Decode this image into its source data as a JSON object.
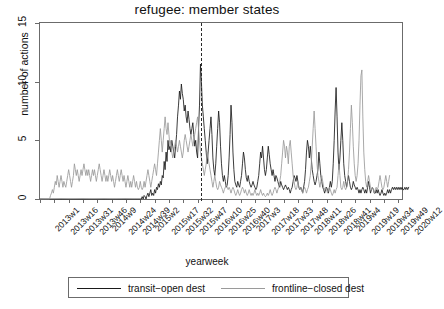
{
  "chart_data": {
    "type": "line",
    "title": "refugee: member states",
    "xlabel": "yearweek",
    "ylabel": "number of actions",
    "ylim": [
      0,
      15
    ],
    "yticks": [
      0,
      5,
      10,
      15
    ],
    "grid": false,
    "legend_position": "bottom",
    "annotations": [
      {
        "type": "vline",
        "style": "dashed",
        "x_index": 169,
        "x_label": "2016w20"
      }
    ],
    "x_tick_labels": [
      "2013w1",
      "2013w16",
      "2013w31",
      "2013w46",
      "2014w9",
      "2014w24",
      "2014w39",
      "2015w2",
      "2015w17",
      "2015w32",
      "2015w47",
      "2016w10",
      "2016w25",
      "2016w40",
      "2017w3",
      "2017w18",
      "2017w33",
      "2017w48",
      "2018w11",
      "2018w26",
      "2018w41",
      "2019w4",
      "2019w19",
      "2019w34",
      "2019w49",
      "2020w12"
    ],
    "x_tick_indices": [
      0,
      15,
      30,
      45,
      60,
      75,
      90,
      105,
      120,
      135,
      150,
      165,
      180,
      195,
      210,
      225,
      240,
      255,
      270,
      285,
      300,
      315,
      330,
      345,
      360,
      375
    ],
    "n_points": 380,
    "series": [
      {
        "name": "transit-open dest",
        "color": "#1a1a1a",
        "values": [
          0,
          0,
          0,
          0,
          0,
          0,
          0,
          0,
          0,
          0,
          0,
          0,
          0,
          0,
          0,
          0,
          0,
          0,
          0,
          0,
          0,
          0,
          0,
          0,
          0,
          0,
          0,
          0,
          0,
          0,
          0,
          0,
          0,
          0,
          0,
          0,
          0,
          0,
          0,
          0,
          0,
          0,
          0,
          0,
          0,
          0,
          0,
          0,
          0,
          0,
          0,
          0,
          0,
          0,
          0,
          0,
          0,
          0,
          0,
          0,
          0,
          0,
          0,
          0,
          0,
          0,
          0,
          0,
          0,
          0,
          0,
          0,
          0,
          0,
          0,
          0,
          0,
          0,
          0,
          0,
          0,
          0,
          0,
          0,
          0,
          0,
          0,
          0,
          0,
          0,
          0,
          0,
          0,
          0,
          0,
          0,
          0,
          0,
          0,
          0,
          0,
          0,
          0,
          0,
          0,
          0,
          0,
          0.2,
          0,
          0.3,
          0.2,
          0,
          0.3,
          0.5,
          0.2,
          0.5,
          0.8,
          0.3,
          0.5,
          0.3,
          0.8,
          0.5,
          1,
          0.8,
          1.3,
          1,
          1.5,
          1.2,
          2,
          1.8,
          3.2,
          2.5,
          4,
          3.2,
          5,
          4.2,
          4.5,
          4,
          5,
          4.5,
          4,
          3.5,
          4.5,
          5.5,
          7,
          8,
          9.2,
          8.5,
          9.8,
          9,
          8.5,
          7.5,
          8,
          7,
          6.5,
          7.5,
          6.8,
          6,
          5.5,
          6,
          6.5,
          5.5,
          4.5,
          5,
          4,
          3.5,
          6,
          8,
          11.5,
          10,
          8,
          7,
          6,
          5,
          4,
          3,
          4,
          5,
          6,
          7,
          5.5,
          3.5,
          2.5,
          2,
          3,
          4.5,
          6,
          7.5,
          6.5,
          4.5,
          3,
          2,
          1.5,
          2,
          1.5,
          1,
          1.2,
          2,
          3.5,
          5.5,
          8,
          6.5,
          4,
          2.5,
          1.5,
          1.2,
          1,
          1.5,
          1.2,
          1,
          1.5,
          2,
          3,
          4,
          3.5,
          2.5,
          1.8,
          1.5,
          2,
          1.5,
          1.2,
          1,
          1.2,
          1.5,
          1.2,
          1,
          0.8,
          1,
          1.5,
          2,
          3,
          4,
          3.5,
          4.5,
          3.5,
          2.5,
          2,
          2.5,
          3.5,
          4.5,
          3.8,
          3,
          2.5,
          2,
          2.5,
          2,
          1.5,
          2,
          1.8,
          1.5,
          1.2,
          1,
          1.5,
          1.2,
          1,
          0.8,
          1,
          1.2,
          1,
          0.8,
          1,
          0.8,
          0.5,
          0.8,
          1,
          1.5,
          2,
          1.8,
          1.5,
          2,
          1.5,
          1,
          0.8,
          1,
          0.8,
          0.5,
          1,
          1.5,
          2.5,
          4,
          5,
          4.5,
          3.5,
          4.5,
          3.5,
          2.5,
          2,
          1.5,
          1.2,
          1.5,
          2,
          2.5,
          4,
          3,
          2,
          1.5,
          1,
          0.8,
          0.5,
          0.8,
          1,
          0.8,
          0.5,
          1,
          1.5,
          1,
          1.5,
          3,
          5,
          7.5,
          9.5,
          7,
          4,
          2.5,
          3.5,
          5,
          6.5,
          5,
          3,
          2,
          1.5,
          1,
          1.5,
          2,
          1.5,
          1,
          0.8,
          1,
          1.5,
          1.2,
          1,
          0.8,
          1,
          0.8,
          0.5,
          0.8,
          0.5,
          0.8,
          1,
          0.8,
          0.5,
          0.8,
          0.5,
          1,
          1.5,
          1,
          0.5,
          0.8,
          1,
          0.8,
          0.5,
          0.5,
          0.8,
          0.5,
          0.8,
          0.5,
          0.3,
          0.5,
          0.8,
          0.5,
          0.3,
          0.5,
          0.3,
          0.5,
          0.8,
          0.5,
          0.8,
          0.5,
          0.8,
          1,
          0.8,
          1,
          0.8,
          1,
          0.8,
          1,
          0.8,
          1,
          0.8,
          1,
          0.8,
          0.8,
          1,
          0.8,
          1,
          0.8,
          1
        ]
      },
      {
        "name": "frontline-closed dest",
        "color": "#9a9a9a",
        "values": [
          0,
          0,
          0,
          0,
          0,
          0,
          0,
          0,
          0,
          0,
          0,
          0.3,
          0.5,
          0.8,
          0.5,
          1,
          1.5,
          1.2,
          2,
          1.5,
          1,
          1.5,
          2,
          1.5,
          1,
          1.5,
          1.2,
          1,
          1.5,
          2,
          2.5,
          2,
          1.5,
          1,
          1.5,
          2,
          3,
          2.5,
          2,
          2.5,
          2,
          1.5,
          2,
          2.5,
          2,
          2.5,
          3,
          2.5,
          2,
          2.5,
          2,
          2.5,
          2,
          1.5,
          2,
          2.5,
          2,
          2.5,
          2,
          1.5,
          2,
          2.5,
          3,
          2.5,
          2,
          1.5,
          2,
          2.5,
          2,
          1.5,
          2,
          1.5,
          2,
          2.5,
          2,
          1.5,
          2,
          1.5,
          1,
          1.5,
          2,
          2.5,
          2,
          1.5,
          2,
          2.5,
          2,
          1.5,
          2,
          1.5,
          1,
          1.5,
          2,
          1.5,
          1,
          1.5,
          1,
          1.5,
          2,
          1.5,
          1,
          1.5,
          1,
          0.8,
          1,
          1.5,
          1,
          0.8,
          1,
          1.5,
          1,
          1.5,
          2,
          2.5,
          2,
          1.5,
          1,
          1.5,
          2,
          2.5,
          3,
          2.5,
          2,
          3,
          4,
          5,
          6,
          5,
          4,
          5,
          6,
          7,
          6,
          5.5,
          6.5,
          5.5,
          4.5,
          5,
          4,
          3.5,
          4,
          4.5,
          5,
          4.5,
          4,
          4.5,
          5,
          4.5,
          4,
          3.5,
          4,
          5,
          5.5,
          5,
          4.5,
          4,
          4.5,
          5,
          5.5,
          5,
          4.5,
          5,
          5.5,
          6,
          6.5,
          7,
          6,
          5,
          4,
          3.5,
          3,
          2.5,
          2,
          2.5,
          3,
          4,
          3.5,
          3,
          2.5,
          2,
          1.5,
          1,
          1.5,
          2,
          1.5,
          1,
          0.8,
          1,
          1.5,
          1.2,
          1,
          0.8,
          0.5,
          0.8,
          1,
          1.2,
          1,
          0.8,
          1,
          0.8,
          0.5,
          0.8,
          1,
          0.8,
          0.5,
          0.3,
          0.5,
          0.8,
          0.5,
          0.3,
          0.5,
          0.8,
          1,
          0.8,
          0.5,
          0.8,
          0.5,
          0.3,
          0.5,
          0.8,
          0.5,
          0.3,
          0.5,
          0.3,
          0.5,
          0.8,
          0.5,
          0.3,
          0.5,
          0.3,
          0.5,
          0.8,
          0.5,
          0.3,
          0.5,
          0.3,
          0.2,
          0.3,
          0.5,
          0.3,
          0.5,
          0.8,
          0.5,
          0.3,
          0.5,
          0.8,
          1,
          0.8,
          0.5,
          0.8,
          1,
          1.5,
          2,
          3,
          4,
          5,
          4.5,
          3.5,
          4.5,
          4,
          3,
          4.5,
          5,
          4,
          3,
          2,
          1.5,
          1,
          0.8,
          1,
          1.5,
          1,
          0.8,
          1,
          0.8,
          0.5,
          0.8,
          1,
          0.8,
          0.5,
          0.8,
          1,
          1.5,
          2,
          3,
          4.5,
          6,
          7.5,
          6,
          4.5,
          3,
          2,
          1.5,
          1,
          1.5,
          2,
          1.5,
          1,
          0.8,
          1,
          0.8,
          0.5,
          0.8,
          1,
          0.8,
          0.5,
          0.3,
          0.5,
          0.8,
          0.5,
          0.8,
          1,
          2,
          3,
          2,
          1,
          0.8,
          1,
          1.5,
          1,
          0.8,
          1,
          1.5,
          2.5,
          4,
          6,
          8,
          6.5,
          4.5,
          3,
          2,
          1.5,
          2,
          3,
          5,
          8,
          10.5,
          11,
          7,
          4,
          2.5,
          1.5,
          1,
          1.5,
          2,
          1.5,
          1,
          0.8,
          1,
          0.8,
          0.5,
          0.8,
          1,
          0.8,
          1,
          1.5,
          2,
          1.5,
          1,
          0.8,
          1,
          1.5,
          2,
          1.5,
          1,
          1.5,
          2
        ]
      }
    ]
  },
  "legend": {
    "entries": [
      {
        "label": "transit−open dest",
        "color": "#1a1a1a"
      },
      {
        "label": "frontline−closed dest",
        "color": "#9a9a9a"
      }
    ]
  },
  "axes": {
    "y_tick_labels": [
      "0",
      "5",
      "10",
      "15"
    ]
  }
}
